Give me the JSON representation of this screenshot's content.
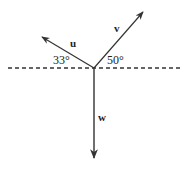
{
  "diagram": {
    "title": "",
    "origin": {
      "x": 94,
      "y": 68
    },
    "reference_line": {
      "style": "dashed",
      "x1": 8,
      "x2": 180,
      "y": 68
    },
    "vectors": [
      {
        "id": "u",
        "label": "u",
        "angle_deg_from_horizontal": 33,
        "direction": "upper-left",
        "tip": {
          "x": 42,
          "y": 37
        }
      },
      {
        "id": "v",
        "label": "v",
        "angle_deg_from_horizontal": 50,
        "direction": "upper-right",
        "tip": {
          "x": 143,
          "y": 12
        }
      },
      {
        "id": "w",
        "label": "w",
        "angle_deg_from_horizontal": 90,
        "direction": "down",
        "tip": {
          "x": 94,
          "y": 158
        }
      }
    ],
    "angle_labels": {
      "u": "33°",
      "v": "50°"
    },
    "colors": {
      "stroke": "#333333",
      "background": "#ffffff"
    }
  }
}
